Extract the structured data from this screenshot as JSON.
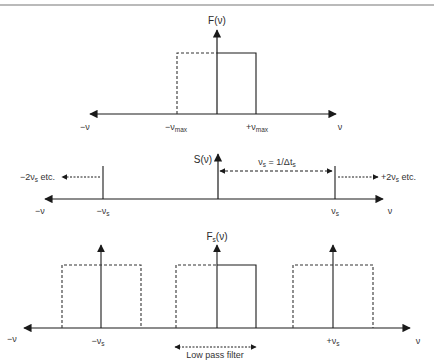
{
  "figure": {
    "colors": {
      "line": "#1a1a1a",
      "text": "#333333",
      "rule": "#777777",
      "background": "#ffffff"
    },
    "panels": [
      {
        "id": "original-spectrum",
        "function_label": {
          "main": "F(ν)"
        },
        "axis_labels": {
          "neg_inf": "−ν",
          "neg_max": {
            "main": "−ν",
            "sub": "max"
          },
          "pos_max": {
            "main": "+ν",
            "sub": "max"
          },
          "pos_inf": "ν"
        },
        "description": "Band-limited spectrum: rectangle from −νmax to +νmax (left half dashed, right half solid)"
      },
      {
        "id": "sampling-function",
        "function_label": {
          "main": "S(ν)"
        },
        "spacing_label": {
          "p1": "ν",
          "s1": "s",
          "p2": " = 1/Δt",
          "s2": "s"
        },
        "left_continuation": {
          "p1": "−2ν",
          "s1": "s",
          "p2": " etc."
        },
        "right_continuation": {
          "p1": "+2ν",
          "s1": "s",
          "p2": " etc."
        },
        "axis_labels": {
          "neg_inf": "−ν",
          "neg_s": {
            "main": "−ν",
            "sub": "s"
          },
          "pos_s": {
            "main": "ν",
            "sub": "s"
          },
          "pos_inf": "ν"
        },
        "description": "Comb of delta spikes spaced νs apart"
      },
      {
        "id": "sampled-spectrum",
        "function_label": {
          "main": "F",
          "sub": "s",
          "tail": "(ν)"
        },
        "axis_labels": {
          "neg_inf": "−ν",
          "neg_s": {
            "main": "−ν",
            "sub": "s"
          },
          "pos_s": {
            "main": "+ν",
            "sub": "s"
          },
          "pos_inf": "ν"
        },
        "filter_label": "Low pass filter",
        "description": "Replicated spectra centered at −νs, 0, +νs"
      }
    ]
  }
}
